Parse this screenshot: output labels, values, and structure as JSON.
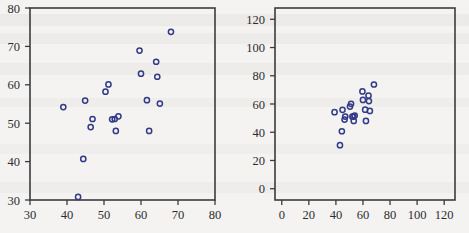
{
  "page": {
    "background_color": "#f4f3f1",
    "marker_color": "#313a86",
    "axis_color": "#3b3b3f",
    "label_color": "#2c2c30"
  },
  "chart_data": [
    {
      "id": "left-scatter",
      "type": "scatter",
      "title": "",
      "subtitle": "",
      "xlabel": "",
      "ylabel": "",
      "xlim": [
        30,
        80
      ],
      "ylim": [
        30,
        80
      ],
      "xticks": [
        30,
        40,
        50,
        60,
        70,
        80
      ],
      "yticks": [
        30,
        40,
        50,
        60,
        70,
        80
      ],
      "xticklabels": [
        "30",
        "40",
        "50",
        "60",
        "70",
        "80"
      ],
      "yticklabels": [
        "30",
        "40",
        "50",
        "60",
        "70",
        "80"
      ],
      "grid": false,
      "legend": false,
      "legend_position": "none",
      "marker": "open-circle",
      "series": [
        {
          "name": "observations",
          "points": [
            [
              39.0,
              54.2
            ],
            [
              43.0,
              30.8
            ],
            [
              44.4,
              40.7
            ],
            [
              44.9,
              55.9
            ],
            [
              46.4,
              49.0
            ],
            [
              46.9,
              51.1
            ],
            [
              50.4,
              58.2
            ],
            [
              51.2,
              60.1
            ],
            [
              52.2,
              51.0
            ],
            [
              52.9,
              51.1
            ],
            [
              53.2,
              48.0
            ],
            [
              53.9,
              51.8
            ],
            [
              59.6,
              68.9
            ],
            [
              60.0,
              62.9
            ],
            [
              61.6,
              56.0
            ],
            [
              62.2,
              48.0
            ],
            [
              64.1,
              66.0
            ],
            [
              64.4,
              62.1
            ],
            [
              65.1,
              55.1
            ],
            [
              68.1,
              73.8
            ]
          ]
        }
      ]
    },
    {
      "id": "right-scatter",
      "type": "scatter",
      "title": "",
      "subtitle": "",
      "xlabel": "",
      "ylabel": "",
      "xlim": [
        -5,
        128
      ],
      "ylim": [
        -8,
        128
      ],
      "xticks": [
        0,
        20,
        40,
        60,
        80,
        100,
        120
      ],
      "yticks": [
        0,
        20,
        40,
        60,
        80,
        100,
        120
      ],
      "xticklabels": [
        "0",
        "20",
        "40",
        "60",
        "80",
        "100",
        "120"
      ],
      "yticklabels": [
        "0",
        "20",
        "40",
        "60",
        "80",
        "100",
        "120"
      ],
      "grid": false,
      "legend": false,
      "legend_position": "none",
      "marker": "open-circle",
      "series": [
        {
          "name": "observations",
          "points": [
            [
              39.0,
              54.2
            ],
            [
              43.0,
              30.8
            ],
            [
              44.4,
              40.7
            ],
            [
              44.9,
              55.9
            ],
            [
              46.4,
              49.0
            ],
            [
              46.9,
              51.1
            ],
            [
              50.4,
              58.2
            ],
            [
              51.2,
              60.1
            ],
            [
              52.2,
              51.0
            ],
            [
              52.9,
              51.1
            ],
            [
              53.2,
              48.0
            ],
            [
              53.9,
              51.8
            ],
            [
              59.6,
              68.9
            ],
            [
              60.0,
              62.9
            ],
            [
              61.6,
              56.0
            ],
            [
              62.2,
              48.0
            ],
            [
              64.1,
              66.0
            ],
            [
              64.4,
              62.1
            ],
            [
              65.1,
              55.1
            ],
            [
              68.1,
              73.8
            ]
          ]
        }
      ]
    }
  ]
}
